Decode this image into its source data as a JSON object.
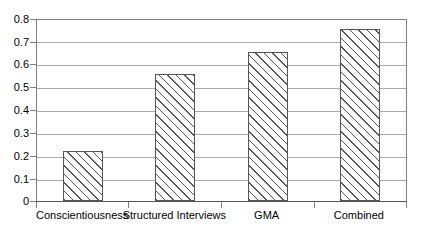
{
  "chart_data": {
    "type": "bar",
    "title": "",
    "subtitle": "",
    "xlabel": "",
    "ylabel": "",
    "categories": [
      "Conscientiousness",
      "Structured Interviews",
      "GMA",
      "Combined"
    ],
    "values": [
      0.22,
      0.56,
      0.66,
      0.76
    ],
    "series": [
      {
        "name": "",
        "values": [
          0.22,
          0.56,
          0.66,
          0.76
        ]
      }
    ],
    "ylim": [
      0,
      0.8
    ],
    "ytick_labels": [
      "0",
      "0.1",
      "0.2",
      "0.3",
      "0.4",
      "0.5",
      "0.6",
      "0.7",
      "0.8"
    ],
    "ytick_values": [
      0,
      0.1,
      0.2,
      0.3,
      0.4,
      0.5,
      0.6,
      0.7,
      0.8
    ],
    "grid": true,
    "grid_axis": "y",
    "legend": false,
    "legend_position": "none",
    "annotations": [],
    "bar_fill": "diagonal-hatch",
    "colors": {
      "bar_edge": "#555555",
      "bar_face": "#ffffff",
      "hatch": "#555555",
      "gridline": "#aaaaaa",
      "axis": "#808080",
      "text": "#000000",
      "background": "#ffffff"
    }
  }
}
